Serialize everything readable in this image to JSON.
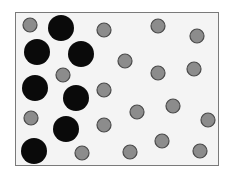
{
  "diagram": {
    "type": "particle-distribution",
    "box": {
      "x": 15,
      "y": 12,
      "width": 204,
      "height": 154,
      "fill": "#f4f4f4",
      "stroke": "#7a7a7a"
    },
    "large_particles": {
      "fill": "#0a0a0a",
      "radius": 13,
      "count": 7,
      "positions": [
        [
          61,
          28
        ],
        [
          37,
          52
        ],
        [
          81,
          54
        ],
        [
          35,
          88
        ],
        [
          76,
          98
        ],
        [
          66,
          129
        ],
        [
          34,
          151
        ]
      ]
    },
    "small_particles": {
      "fill": "#8c8c8c",
      "stroke": "#4a4a4a",
      "radius": 7,
      "count": 18,
      "positions": [
        [
          30,
          25
        ],
        [
          104,
          30
        ],
        [
          158,
          26
        ],
        [
          197,
          36
        ],
        [
          125,
          61
        ],
        [
          158,
          73
        ],
        [
          194,
          69
        ],
        [
          63,
          75
        ],
        [
          104,
          90
        ],
        [
          31,
          118
        ],
        [
          137,
          112
        ],
        [
          173,
          106
        ],
        [
          208,
          120
        ],
        [
          104,
          125
        ],
        [
          82,
          153
        ],
        [
          130,
          152
        ],
        [
          162,
          141
        ],
        [
          200,
          151
        ]
      ]
    }
  }
}
